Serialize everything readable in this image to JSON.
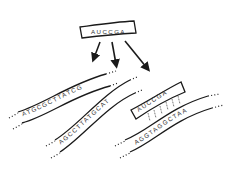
{
  "diagram": {
    "type": "hybridization",
    "probe": {
      "label": "AUCCGA"
    },
    "arrows": [
      {
        "from": "probe",
        "to": "strand-1"
      },
      {
        "from": "probe",
        "to": "strand-2"
      },
      {
        "from": "probe",
        "to": "strand-3"
      }
    ],
    "strands": [
      {
        "id": "strand-1",
        "sequence": "ATGCGCTTATCG",
        "bound": false
      },
      {
        "id": "strand-2",
        "sequence": "AGCCTTATGCAT",
        "bound": false
      },
      {
        "id": "strand-3",
        "sequence": "AGGTAGGCTAA",
        "bound": true,
        "bound_probe": "AUCCGA"
      }
    ],
    "colors": {
      "line": "#1a1a1a",
      "text": "#333333",
      "background": "#ffffff"
    }
  }
}
